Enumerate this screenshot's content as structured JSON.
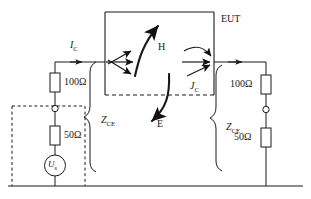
{
  "diagram": {
    "type": "schematic",
    "stroke_color": "#1a1a1a",
    "background": "#ffffff"
  },
  "labels": {
    "eut": "EUT",
    "current_in": "I",
    "current_in_sub": "C",
    "current_out": "J",
    "current_out_sub": "C",
    "field_h": "H",
    "field_e": "E",
    "impedance_left": "Z",
    "impedance_left_sub": "CE",
    "impedance_right": "Z",
    "impedance_right_sub": "CE",
    "source": "U",
    "source_sub": "s"
  },
  "components": {
    "left_resistor_top": "100Ω",
    "left_resistor_bottom": "50Ω",
    "right_resistor_top": "100Ω",
    "right_resistor_bottom": "50Ω"
  },
  "icons": {
    "source": "voltage-source-icon",
    "resistor": "resistor-icon",
    "node": "connector-node-icon",
    "ground": "ground-line-icon",
    "arrow_field": "field-arrow-icon",
    "brace": "curly-brace-icon"
  }
}
